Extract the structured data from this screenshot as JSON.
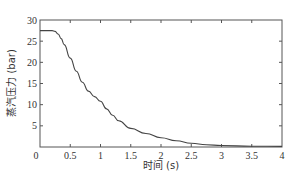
{
  "chart_data": {
    "type": "line",
    "title": "",
    "xlabel": "时间 (s)",
    "ylabel": "蒸汽压力 (bar)",
    "xlim": [
      0,
      4
    ],
    "ylim": [
      0,
      30
    ],
    "grid": false,
    "legend": null,
    "x_ticks": [
      0,
      0.5,
      1,
      1.5,
      2,
      2.5,
      3,
      3.5,
      4
    ],
    "x_tick_labels": [
      "0",
      "0.5",
      "1",
      "1.5",
      "2",
      "2.5",
      "3",
      "3.5",
      "4"
    ],
    "y_ticks": [
      0,
      5,
      10,
      15,
      20,
      25,
      30
    ],
    "y_tick_labels": [
      "0",
      "5",
      "10",
      "15",
      "20",
      "25",
      "30"
    ],
    "series": [
      {
        "name": "蒸汽压力",
        "color": "#444444",
        "x": [
          0,
          0.1,
          0.2,
          0.25,
          0.3,
          0.35,
          0.4,
          0.5,
          0.6,
          0.7,
          0.8,
          0.9,
          1.0,
          1.1,
          1.2,
          1.3,
          1.5,
          1.75,
          2.0,
          2.25,
          2.5,
          2.75,
          3.0,
          3.5,
          4.0
        ],
        "y": [
          27.5,
          27.5,
          27.5,
          27.3,
          26.7,
          25.6,
          24.2,
          21.0,
          17.9,
          15.3,
          13.2,
          11.9,
          10.8,
          9.0,
          7.5,
          6.2,
          4.4,
          3.2,
          2.2,
          1.5,
          0.9,
          0.55,
          0.35,
          0.2,
          0.15
        ]
      }
    ]
  },
  "layout": {
    "plot_left": 40,
    "plot_right": 282,
    "plot_top": 20,
    "plot_bottom": 147
  }
}
